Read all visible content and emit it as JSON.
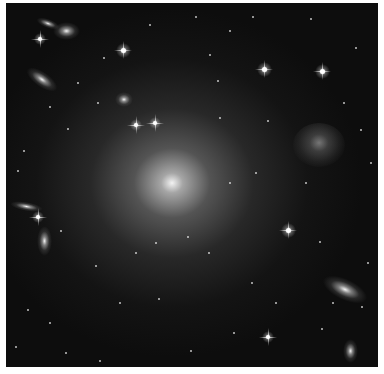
{
  "image": {
    "subject": "deep-field galaxy image, giant elliptical galaxy at center",
    "palette": "grayscale",
    "background_color": "#0d0d0d",
    "border_color": "#ffffff"
  },
  "central_galaxy": {
    "x": 166,
    "y": 180,
    "rx": 120,
    "ry": 110
  },
  "galaxies": [
    {
      "x": 60,
      "y": 28,
      "rx": 9,
      "ry": 6,
      "rot": 0
    },
    {
      "x": 42,
      "y": 20,
      "rx": 8,
      "ry": 3,
      "rot": 20
    },
    {
      "x": 36,
      "y": 76,
      "rx": 12,
      "ry": 5,
      "rot": 35
    },
    {
      "x": 20,
      "y": 203,
      "rx": 11,
      "ry": 3,
      "rot": 10
    },
    {
      "x": 38,
      "y": 238,
      "rx": 5,
      "ry": 10,
      "rot": 0
    },
    {
      "x": 339,
      "y": 286,
      "rx": 16,
      "ry": 7,
      "rot": 25
    },
    {
      "x": 344,
      "y": 348,
      "rx": 5,
      "ry": 8,
      "rot": 0
    },
    {
      "x": 118,
      "y": 96,
      "rx": 6,
      "ry": 5,
      "rot": 0
    }
  ],
  "irregular_galaxy": {
    "x": 313,
    "y": 142,
    "rx": 26,
    "ry": 22
  },
  "bright_stars": [
    {
      "x": 117,
      "y": 47,
      "r": 2.5
    },
    {
      "x": 316,
      "y": 68,
      "r": 2.5
    },
    {
      "x": 258,
      "y": 66,
      "r": 2.5
    },
    {
      "x": 282,
      "y": 227,
      "r": 2.5
    },
    {
      "x": 130,
      "y": 122,
      "r": 2
    },
    {
      "x": 149,
      "y": 120,
      "r": 2
    },
    {
      "x": 34,
      "y": 36,
      "r": 2
    },
    {
      "x": 32,
      "y": 214,
      "r": 2
    },
    {
      "x": 262,
      "y": 334,
      "r": 2
    }
  ],
  "faint_stars": [
    {
      "x": 98,
      "y": 55
    },
    {
      "x": 144,
      "y": 22
    },
    {
      "x": 204,
      "y": 52
    },
    {
      "x": 212,
      "y": 78
    },
    {
      "x": 224,
      "y": 28
    },
    {
      "x": 247,
      "y": 14
    },
    {
      "x": 305,
      "y": 16
    },
    {
      "x": 350,
      "y": 45
    },
    {
      "x": 355,
      "y": 127
    },
    {
      "x": 338,
      "y": 100
    },
    {
      "x": 262,
      "y": 118
    },
    {
      "x": 214,
      "y": 115
    },
    {
      "x": 72,
      "y": 80
    },
    {
      "x": 44,
      "y": 104
    },
    {
      "x": 62,
      "y": 126
    },
    {
      "x": 92,
      "y": 100
    },
    {
      "x": 18,
      "y": 148
    },
    {
      "x": 12,
      "y": 168
    },
    {
      "x": 55,
      "y": 228
    },
    {
      "x": 90,
      "y": 263
    },
    {
      "x": 114,
      "y": 300
    },
    {
      "x": 22,
      "y": 307
    },
    {
      "x": 44,
      "y": 320
    },
    {
      "x": 60,
      "y": 350
    },
    {
      "x": 94,
      "y": 358
    },
    {
      "x": 153,
      "y": 296
    },
    {
      "x": 185,
      "y": 348
    },
    {
      "x": 228,
      "y": 330
    },
    {
      "x": 314,
      "y": 239
    },
    {
      "x": 327,
      "y": 300
    },
    {
      "x": 356,
      "y": 304
    },
    {
      "x": 362,
      "y": 260
    },
    {
      "x": 316,
      "y": 326
    },
    {
      "x": 250,
      "y": 170
    },
    {
      "x": 300,
      "y": 180
    },
    {
      "x": 246,
      "y": 280
    },
    {
      "x": 203,
      "y": 250
    },
    {
      "x": 182,
      "y": 234
    },
    {
      "x": 224,
      "y": 180
    },
    {
      "x": 150,
      "y": 240
    },
    {
      "x": 10,
      "y": 344
    },
    {
      "x": 130,
      "y": 250
    },
    {
      "x": 270,
      "y": 300
    },
    {
      "x": 365,
      "y": 160
    },
    {
      "x": 190,
      "y": 14
    }
  ]
}
